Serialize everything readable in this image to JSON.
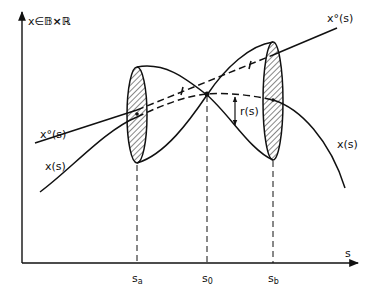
{
  "diagram": {
    "axes": {
      "y_label_prefix": "x",
      "y_label_in": "∈",
      "y_label_set": "𝔹×ℝ",
      "x_label": "s"
    },
    "ticks": [
      {
        "label": "s",
        "sub": "a"
      },
      {
        "label": "s",
        "sub": "0"
      },
      {
        "label": "s",
        "sub": "b"
      }
    ],
    "curves": {
      "reference_top_label": "x°(s)",
      "reference_left_label": "x°(s)",
      "solution_left_label": "x(s)",
      "solution_right_label": "x(s)",
      "radius_label": "r(s)"
    }
  }
}
